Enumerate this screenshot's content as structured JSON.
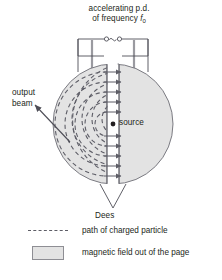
{
  "figure": {
    "caption_title": {
      "line1": "accelerating p.d.",
      "line2_prefix": "of frequency ",
      "line2_symbol": "f",
      "line2_subscript": "0"
    },
    "output_label": {
      "line1": "output",
      "line2": "beam"
    },
    "source_label": "source",
    "dees_label": "Dees",
    "ac_source_symbol": "~"
  },
  "legend": {
    "items": [
      {
        "key": "dashed-line",
        "text": "path of charged particle"
      },
      {
        "key": "gray-swatch",
        "text": "magnetic field out of the page"
      }
    ]
  },
  "colors": {
    "field_fill": "#e3e3e3",
    "outline": "#6e6e76",
    "path": "#5d5d66",
    "text": "#231f20",
    "gap_fill": "#ffffff",
    "lead": "#9a9aa0"
  },
  "geometry": {
    "center_x": 113,
    "center_y": 124,
    "outer_radius": 60,
    "gap_half_width": 6,
    "spiral_radii": [
      12,
      22,
      32,
      42,
      52
    ]
  }
}
